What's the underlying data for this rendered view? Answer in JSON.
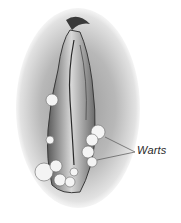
{
  "figure": {
    "type": "medical-illustration",
    "style": "grayscale pencil sketch",
    "labels": [
      {
        "text": "Warts",
        "pointer_count": 2
      }
    ]
  },
  "colors": {
    "background": "#ffffff",
    "shading": "#8a8a8a",
    "outline": "#2a2a2a",
    "highlight": "#f2f2f2"
  }
}
